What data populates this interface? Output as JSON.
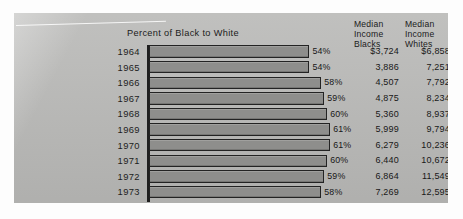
{
  "chart_data": {
    "type": "bar",
    "title": "Percent of Black to White",
    "xlabel": "",
    "ylabel": "",
    "orientation": "horizontal",
    "grid": false,
    "legend": false,
    "xlim": [
      0,
      66
    ],
    "categories": [
      "1964",
      "1965",
      "1966",
      "1967",
      "1968",
      "1969",
      "1970",
      "1971",
      "1972",
      "1973"
    ],
    "values": [
      54,
      54,
      58,
      59,
      60,
      61,
      61,
      60,
      59,
      58
    ],
    "value_labels": [
      "54%",
      "54%",
      "58%",
      "59%",
      "60%",
      "61%",
      "61%",
      "60%",
      "59%",
      "58%"
    ],
    "table_columns": [
      "Median Income Blacks",
      "Median Income Whites"
    ],
    "series": [
      {
        "name": "Median Income Blacks",
        "values": [
          3724,
          3886,
          4507,
          4875,
          5360,
          5999,
          6279,
          6440,
          6864,
          7269
        ]
      },
      {
        "name": "Median Income Whites",
        "values": [
          6858,
          7251,
          7792,
          8234,
          8937,
          9794,
          10236,
          10672,
          11549,
          12595
        ]
      }
    ]
  },
  "chart": {
    "title": "Percent of Black to White",
    "headers": {
      "blacks": [
        "Median",
        "Income",
        "Blacks"
      ],
      "whites": [
        "Median",
        "Income",
        "Whites"
      ]
    },
    "rows": [
      {
        "year": "1964",
        "pct": 54,
        "pct_label": "54%",
        "blacks": "$3,724",
        "whites": "$6,858"
      },
      {
        "year": "1965",
        "pct": 54,
        "pct_label": "54%",
        "blacks": "3,886",
        "whites": "7,251"
      },
      {
        "year": "1966",
        "pct": 58,
        "pct_label": "58%",
        "blacks": "4,507",
        "whites": "7,792"
      },
      {
        "year": "1967",
        "pct": 59,
        "pct_label": "59%",
        "blacks": "4,875",
        "whites": "8,234"
      },
      {
        "year": "1968",
        "pct": 60,
        "pct_label": "60%",
        "blacks": "5,360",
        "whites": "8,937"
      },
      {
        "year": "1969",
        "pct": 61,
        "pct_label": "61%",
        "blacks": "5,999",
        "whites": "9,794"
      },
      {
        "year": "1970",
        "pct": 61,
        "pct_label": "61%",
        "blacks": "6,279",
        "whites": "10,236"
      },
      {
        "year": "1971",
        "pct": 60,
        "pct_label": "60%",
        "blacks": "6,440",
        "whites": "10,672"
      },
      {
        "year": "1972",
        "pct": 59,
        "pct_label": "59%",
        "blacks": "6,864",
        "whites": "11,549"
      },
      {
        "year": "1973",
        "pct": 58,
        "pct_label": "58%",
        "blacks": "7,269",
        "whites": "12,595"
      }
    ]
  },
  "colors": {
    "panel_background": "#b9b9b7",
    "bar_fill": "#8e8e8c",
    "bar_outline": "#232323",
    "axis": "#1f1f1f",
    "text": "#1b1b1b",
    "page_background": "#fdfdfd"
  }
}
